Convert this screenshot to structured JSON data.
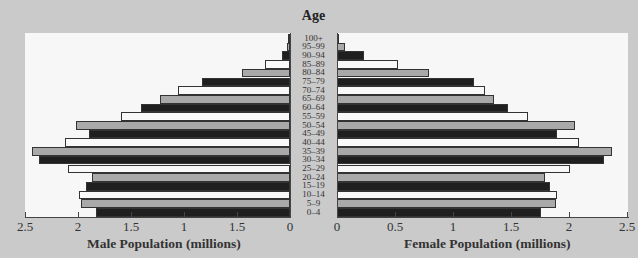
{
  "chart_data": {
    "type": "bar",
    "subtype": "population-pyramid",
    "title": "",
    "center_label": "Age",
    "categories": [
      "100+",
      "95–99",
      "90–94",
      "85–89",
      "80–84",
      "75–79",
      "70–74",
      "65–69",
      "60–64",
      "55–59",
      "50–54",
      "45–49",
      "40–44",
      "35–39",
      "30–34",
      "25–29",
      "20–24",
      "15–19",
      "10–14",
      "5–9",
      "0–4"
    ],
    "series": [
      {
        "name": "Male Population (millions)",
        "side": "left",
        "values": [
          0.01,
          0.03,
          0.08,
          0.24,
          0.45,
          0.83,
          1.06,
          1.23,
          1.41,
          1.59,
          2.02,
          1.9,
          2.12,
          2.43,
          2.37,
          2.09,
          1.87,
          1.92,
          1.99,
          1.97,
          1.83
        ]
      },
      {
        "name": "Female Population (millions)",
        "side": "right",
        "values": [
          0.01,
          0.07,
          0.23,
          0.53,
          0.79,
          1.18,
          1.28,
          1.35,
          1.47,
          1.65,
          2.05,
          1.9,
          2.09,
          2.37,
          2.3,
          2.01,
          1.79,
          1.84,
          1.9,
          1.89,
          1.76
        ]
      }
    ],
    "bar_fill_cycle_bottom_up": [
      "black",
      "gray",
      "white"
    ],
    "xlabel_left": "Male Population (millions)",
    "xlabel_right": "Female Population (millions)",
    "ylabel": "Age",
    "xlim_left": [
      2.5,
      0
    ],
    "xlim_right": [
      0,
      2.5
    ],
    "left_tick_labels": [
      "2.5",
      "2",
      "1.5",
      "1",
      "1.5",
      "0"
    ],
    "left_tick_values": [
      2.5,
      2,
      1.5,
      1,
      0.5,
      0
    ],
    "right_tick_labels": [
      "0",
      "0.5",
      "1",
      "1.5",
      "2",
      "2.5"
    ],
    "right_tick_values": [
      0,
      0.5,
      1,
      1.5,
      2,
      2.5
    ],
    "grid": false,
    "legend": "none"
  },
  "colors": {
    "background": "#cacaca",
    "panel": "#f7f7f7",
    "black": "#1f1f1f",
    "gray": "#a9a9a9",
    "white": "#f9f9f9"
  }
}
